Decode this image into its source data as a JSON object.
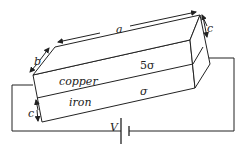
{
  "diagram": {
    "labels": {
      "a": "a",
      "b": "b",
      "c_top": "c",
      "c_left": "c",
      "copper": "copper",
      "iron": "iron",
      "copper_conductivity": "5σ",
      "iron_conductivity": "σ",
      "voltage": "V"
    },
    "colors": {
      "line": "#222222",
      "background": "#ffffff"
    }
  }
}
